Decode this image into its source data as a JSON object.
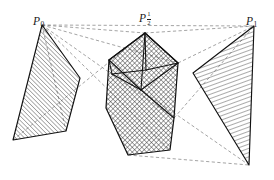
{
  "figure": {
    "background_color": "#ffffff",
    "stroke_color": "#1a1a1a",
    "dash_color": "#555555",
    "width": 274,
    "height": 180,
    "labels": [
      {
        "id": "p0",
        "base": "P",
        "sub": "0",
        "sub_type": "plain",
        "x": 33,
        "y": 12
      },
      {
        "id": "phalf",
        "base": "P",
        "num": "1",
        "den": "2",
        "sub_type": "fraction",
        "x": 139,
        "y": 9
      },
      {
        "id": "p1",
        "base": "P",
        "sub": "1",
        "sub_type": "plain",
        "x": 246,
        "y": 12
      }
    ],
    "shapes": {
      "left_polygon": {
        "name": "P_0 quadrilateral",
        "points": "42,25 80,78 66,131 13,140",
        "hatch": "diagonal-up",
        "hatch_angle_deg": 45,
        "hatch_spacing_px": 3.1
      },
      "center_polygon": {
        "name": "P_1/2 hexagon",
        "points": "145,33 178,63 174,118 170,150 128,155 106,108 109,60",
        "hatch": "cross",
        "hatch_angle_deg": 45,
        "hatch_spacing_px": 3.4
      },
      "right_polygon": {
        "name": "P_1 triangle",
        "points": "254,26 193,73 249,165",
        "hatch": "horizontal-slight",
        "hatch_angle_deg": 20,
        "hatch_spacing_px": 4.0
      }
    },
    "interior_wireframe": {
      "name": "center box wireframe",
      "segments": [
        "145,33 109,60",
        "145,33 178,63",
        "145,33 141,90",
        "109,60 141,90",
        "178,63 141,90",
        "109,60 112,74",
        "112,74 141,90",
        "112,74 146,70",
        "146,70 178,63",
        "146,70 145,33",
        "141,90 174,118"
      ]
    },
    "dashed_lines": {
      "name": "projection rays",
      "segments": [
        "42,25 145,33",
        "145,33 254,26",
        "42,25 254,26",
        "42,25 178,63",
        "42,25 174,118",
        "42,25 170,150",
        "42,25 66,131",
        "13,140 145,33",
        "174,118 254,26",
        "178,63 254,26",
        "128,155 249,165",
        "141,90 249,165"
      ]
    }
  }
}
